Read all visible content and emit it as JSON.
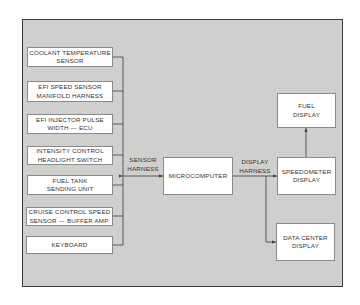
{
  "inputs": [
    {
      "line1": "COOLANT TEMPERATURE",
      "line2": "SENSOR"
    },
    {
      "line1": "EFI SPEED SENSOR",
      "line2": "MANIFOLD HARNESS"
    },
    {
      "line1": "EFI INJECTOR PULSE",
      "line2": "WIDTH — ECU"
    },
    {
      "line1": "INTENSITY CONTROL",
      "line2": "HEADLIGHT SWITCH"
    },
    {
      "line1": "FUEL TANK",
      "line2": "SENDING UNIT"
    },
    {
      "line1": "CRUISE CONTROL SPEED",
      "line2": "SENSOR — BUFFER AMP."
    },
    {
      "line1": "KEYBOARD",
      "line2": ""
    }
  ],
  "sensor_harness": {
    "line1": "SENSOR",
    "line2": "HARNESS"
  },
  "microcomputer": "MICROCOMPUTER",
  "display_harness": {
    "line1": "DISPLAY",
    "line2": "HARNESS"
  },
  "outputs": {
    "fuel": {
      "line1": "FUEL",
      "line2": "DISPLAY"
    },
    "speedometer": {
      "line1": "SPEEDOMETER",
      "line2": "DISPLAY"
    },
    "data_center": {
      "line1": "DATA CENTER",
      "line2": "DISPLAY"
    }
  },
  "colors": {
    "background": "#cfcfcd",
    "box": "#ffffff",
    "line": "#3a3a3a"
  }
}
